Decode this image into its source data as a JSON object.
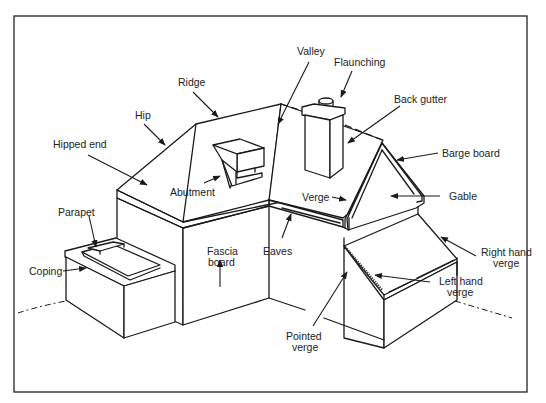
{
  "diagram": {
    "labels": {
      "ridge": "Ridge",
      "hip": "Hip",
      "hipped_end": "Hipped end",
      "abutment": "Abutment",
      "valley": "Valley",
      "flaunching": "Flaunching",
      "back_gutter": "Back gutter",
      "barge_board": "Barge board",
      "gable": "Gable",
      "verge": "Verge",
      "parapet": "Parapet",
      "coping": "Coping",
      "fascia_line1": "Fascia",
      "fascia_line2": "board",
      "eaves": "Eaves",
      "right_hand_verge_line1": "Right hand",
      "right_hand_verge_line2": "verge",
      "left_hand_verge_line1": "Left hand",
      "left_hand_verge_line2": "verge",
      "pointed_verge_line1": "Pointed",
      "pointed_verge_line2": "verge"
    },
    "colors": {
      "line": "#1a1a1a",
      "background": "#ffffff"
    }
  }
}
